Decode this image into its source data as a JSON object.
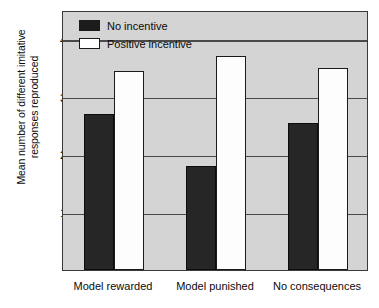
{
  "chart_data": {
    "type": "bar",
    "title": "",
    "xlabel": "",
    "ylabel": "Mean number of different imitative responses reproduced",
    "ylabel_line1": "Mean number of different imitative",
    "ylabel_line2": "responses reproduced",
    "categories": [
      "Model rewarded",
      "Model punished",
      "No consequences"
    ],
    "series": [
      {
        "name": "No incentive",
        "values": [
          2.7,
          1.8,
          2.55
        ],
        "color": "#262626"
      },
      {
        "name": "Positive incentive",
        "values": [
          3.45,
          3.7,
          3.5
        ],
        "color": "#ffffff"
      }
    ],
    "ylim": [
      0,
      4.5
    ],
    "yticks": [
      1,
      2,
      3,
      4
    ],
    "ytick_labels": [
      "1",
      "2",
      "3",
      "4"
    ],
    "grid": true,
    "grid_axis": "y",
    "legend_position": "upper left",
    "plot_background": "#d4d4d4",
    "axis_color": "#3a3a3a",
    "text_color": "#0b0b0b"
  }
}
